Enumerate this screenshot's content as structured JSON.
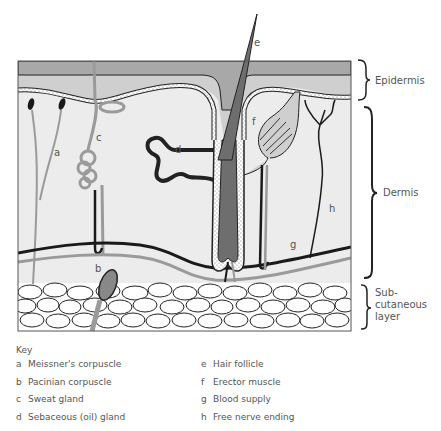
{
  "figure": {
    "colors": {
      "outer_epidermis": "#a8a8a8",
      "inner_epidermis": "#cfcfcf",
      "dermis": "#ececec",
      "hair": "#6e6e6e",
      "nerve_grey": "#9a9a9a",
      "nerve_black": "#1a1a1a",
      "fat_cells": "#ffffff"
    },
    "structure_labels": {
      "a": "a",
      "b": "b",
      "c": "c",
      "d": "d",
      "e": "e",
      "f": "f",
      "g": "g",
      "h": "h"
    },
    "layers": {
      "epidermis": "Epidermis",
      "dermis": "Dermis",
      "subcutaneous_line1": "Sub-",
      "subcutaneous_line2": "cutaneous",
      "subcutaneous_line3": "layer"
    }
  },
  "key": {
    "title": "Key",
    "left": [
      {
        "letter": "a",
        "label": "Meissner's corpuscle"
      },
      {
        "letter": "b",
        "label": "Pacinian corpuscle"
      },
      {
        "letter": "c",
        "label": "Sweat gland"
      },
      {
        "letter": "d",
        "label": "Sebaceous (oil) gland"
      }
    ],
    "right": [
      {
        "letter": "e",
        "label": "Hair follicle"
      },
      {
        "letter": "f",
        "label": "Erector muscle"
      },
      {
        "letter": "g",
        "label": "Blood supply"
      },
      {
        "letter": "h",
        "label": "Free nerve ending"
      }
    ]
  }
}
